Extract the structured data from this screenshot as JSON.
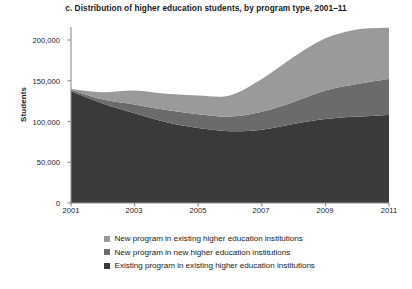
{
  "chart_data": {
    "type": "area",
    "stacked": true,
    "title": "c. Distribution of higher education students, by program type, 2001–11",
    "xlabel": "",
    "ylabel": "Students",
    "x": [
      2001,
      2002,
      2003,
      2004,
      2005,
      2006,
      2007,
      2008,
      2009,
      2010,
      2011
    ],
    "xticks": [
      "2001",
      "2003",
      "2005",
      "2007",
      "2009",
      "2011"
    ],
    "xtick_values": [
      2001,
      2003,
      2005,
      2007,
      2009,
      2011
    ],
    "yticks": [
      "0",
      "50,000",
      "100,000",
      "150,000",
      "200,000"
    ],
    "ytick_values": [
      0,
      50000,
      100000,
      150000,
      200000
    ],
    "xlim": [
      2001,
      2011
    ],
    "ylim": [
      0,
      215000
    ],
    "grid": false,
    "legend_position": "bottom",
    "series": [
      {
        "name": "Existing program in existing higher education institutions",
        "color": "#3a3a3a",
        "stack_order": 1,
        "values": [
          137000,
          122000,
          110000,
          99000,
          92000,
          88000,
          90000,
          97000,
          103000,
          106000,
          108000
        ]
      },
      {
        "name": "New program in new higher education institutions",
        "color": "#6b6b6b",
        "stack_order": 2,
        "values": [
          2000,
          5000,
          11000,
          15000,
          17000,
          18000,
          22000,
          27000,
          35000,
          40000,
          44000
        ]
      },
      {
        "name": "New program in existing higher education institutions",
        "color": "#9a9a9a",
        "stack_order": 3,
        "values": [
          1000,
          9000,
          17000,
          20000,
          23000,
          26000,
          40000,
          55000,
          64000,
          67000,
          63000
        ]
      }
    ],
    "totals": [
      140000,
      136000,
      138000,
      134000,
      132000,
      132000,
      152000,
      179000,
      202000,
      213000,
      215000
    ]
  },
  "legend": {
    "items": [
      {
        "label": "New program in existing higher education institutions",
        "color": "#9a9a9a",
        "swatch_name": "legend-swatch-new-program-existing-institutions"
      },
      {
        "label": "New program in new higher education institutions",
        "color": "#6b6b6b",
        "swatch_name": "legend-swatch-new-program-new-institutions"
      },
      {
        "label": "Existing program in existing higher education institutions",
        "color": "#3a3a3a",
        "swatch_name": "legend-swatch-existing-program-existing-institutions"
      }
    ]
  },
  "axes": {
    "y_axis_title": "Students",
    "axis_color": "#8d8d8d"
  }
}
